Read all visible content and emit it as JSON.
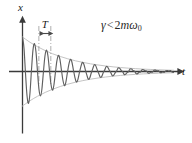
{
  "figure": {
    "axis_x_label": "x",
    "axis_t_label": "t",
    "period_label": "T",
    "condition": {
      "full_text": "γ < 2mω₀",
      "gamma": "γ",
      "relation": "<",
      "coefficient": "2",
      "mass": "m",
      "omega": "ω",
      "omega_subscript": "0"
    },
    "colors": {
      "curve": "#606060",
      "envelope": "#c4c4c4",
      "axis": "#3a3a3a",
      "marker": "#4a4a4a",
      "background": "#ffffff",
      "text": "#1a1a1a"
    }
  },
  "chart_data": {
    "type": "line",
    "xlabel": "t",
    "ylabel": "x",
    "grid": false,
    "legend": null,
    "xlim": [
      0,
      12.2
    ],
    "ylim": [
      -1.05,
      1.05
    ],
    "annotations": [
      {
        "text": "γ < 2mω₀",
        "x": 6.6,
        "y": 0.85
      },
      {
        "text": "T",
        "x": 1.72,
        "y": 0.86
      }
    ],
    "period_marker": {
      "label": "T",
      "t_start": 1.3,
      "t_end": 2.25,
      "period_value": 0.95
    },
    "model": {
      "equation": "x(t) = A e^(-t/tau) cos(2*pi*t/T)",
      "amplitude": 1.0,
      "decay_tau": 3.6,
      "period": 0.95,
      "phase": 0.0,
      "cycles_visible": 11
    },
    "series": [
      {
        "name": "x(t)",
        "color": "#606060",
        "x": [
          0.0,
          0.12,
          0.24,
          0.36,
          0.48,
          0.59,
          0.71,
          0.83,
          0.95,
          1.07,
          1.19,
          1.31,
          1.43,
          1.54,
          1.66,
          1.78,
          1.9,
          2.02,
          2.14,
          2.26,
          2.38,
          2.49,
          2.61,
          2.73,
          2.85,
          2.97,
          3.09,
          3.21,
          3.33,
          3.44,
          3.56,
          3.68,
          3.8,
          3.92,
          4.04,
          4.16,
          4.28,
          4.39,
          4.51,
          4.63,
          4.75,
          4.87,
          4.99,
          5.11,
          5.23,
          5.34,
          5.46,
          5.58,
          5.7,
          5.82,
          5.94,
          6.06,
          6.18,
          6.29,
          6.41,
          6.53,
          6.65,
          6.77,
          6.89,
          7.01,
          7.13,
          7.24,
          7.36,
          7.48,
          7.6,
          7.72,
          7.84,
          7.96,
          8.08,
          8.19,
          8.31,
          8.43,
          8.55,
          8.67,
          8.79,
          8.91,
          9.03,
          9.14,
          9.26,
          9.38,
          9.5,
          9.62,
          9.74,
          9.86,
          9.98,
          10.09,
          10.21,
          10.33,
          10.45,
          10.57,
          10.69,
          10.81,
          10.93,
          11.04,
          11.16,
          11.28,
          11.4,
          11.52,
          11.64,
          11.76,
          11.88,
          12.0
        ],
        "y": [
          1.0,
          0.676,
          -0.06,
          -0.702,
          -0.924,
          -0.641,
          0.02,
          0.611,
          0.81,
          0.572,
          0.009,
          -0.519,
          -0.709,
          -0.513,
          -0.029,
          0.436,
          0.619,
          0.457,
          0.042,
          -0.363,
          -0.539,
          -0.406,
          -0.05,
          0.3,
          0.468,
          0.36,
          0.055,
          -0.246,
          -0.406,
          -0.319,
          -0.057,
          0.2,
          0.351,
          0.282,
          0.057,
          -0.161,
          -0.303,
          -0.249,
          -0.056,
          0.128,
          0.261,
          0.219,
          0.054,
          -0.1,
          -0.224,
          -0.192,
          -0.051,
          0.076,
          0.192,
          0.168,
          0.048,
          -0.056,
          -0.164,
          -0.147,
          -0.045,
          0.04,
          0.14,
          0.128,
          0.041,
          -0.026,
          -0.119,
          -0.111,
          -0.038,
          0.014,
          0.101,
          0.096,
          0.035,
          -0.005,
          -0.086,
          -0.083,
          -0.031,
          -0.002,
          0.072,
          0.072,
          0.028,
          0.008,
          -0.061,
          -0.062,
          -0.025,
          -0.013,
          0.051,
          0.053,
          0.022,
          0.017,
          -0.042,
          -0.046,
          -0.02,
          -0.02,
          0.035,
          0.039,
          0.017,
          0.022,
          -0.028,
          -0.033,
          -0.015,
          -0.024,
          0.023,
          0.028,
          0.013,
          0.025,
          -0.018,
          -0.024
        ]
      },
      {
        "name": "upper envelope",
        "color": "#c4c4c4",
        "x": [
          0.0,
          0.6,
          1.2,
          1.8,
          2.4,
          3.0,
          3.6,
          4.2,
          4.8,
          5.4,
          6.0,
          6.6,
          7.2,
          7.8,
          8.4,
          9.0,
          9.6,
          10.2,
          10.8,
          11.4,
          12.0
        ],
        "y": [
          1.0,
          0.846,
          0.717,
          0.607,
          0.513,
          0.435,
          0.368,
          0.311,
          0.264,
          0.223,
          0.189,
          0.16,
          0.135,
          0.114,
          0.097,
          0.082,
          0.069,
          0.059,
          0.05,
          0.042,
          0.036
        ]
      },
      {
        "name": "lower envelope",
        "color": "#c4c4c4",
        "x": [
          0.0,
          0.6,
          1.2,
          1.8,
          2.4,
          3.0,
          3.6,
          4.2,
          4.8,
          5.4,
          6.0,
          6.6,
          7.2,
          7.8,
          8.4,
          9.0,
          9.6,
          10.2,
          10.8,
          11.4,
          12.0
        ],
        "y": [
          -1.0,
          -0.846,
          -0.717,
          -0.607,
          -0.513,
          -0.435,
          -0.368,
          -0.311,
          -0.264,
          -0.223,
          -0.189,
          -0.16,
          -0.135,
          -0.114,
          -0.097,
          -0.082,
          -0.069,
          -0.059,
          -0.05,
          -0.042,
          -0.036
        ]
      }
    ]
  }
}
